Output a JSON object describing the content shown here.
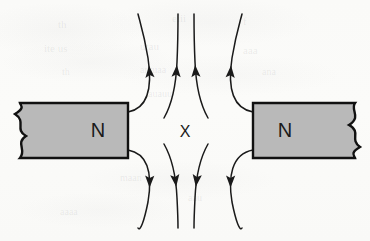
{
  "figure": {
    "background_color": "#fbfbfa",
    "ink_color": "#1a1a1a",
    "magnet_fill_color": "#b9b9b9",
    "magnet_border_color": "#111111"
  },
  "magnets": [
    {
      "id": "left-magnet",
      "pole_label": "N",
      "side": "left",
      "x": 20,
      "y": 103,
      "width": 108,
      "height": 55,
      "label_x": 98,
      "label_y": 132,
      "torn_edge": "left"
    },
    {
      "id": "right-magnet",
      "pole_label": "N",
      "side": "right",
      "x": 253,
      "y": 103,
      "width": 102,
      "height": 55,
      "label_x": 285,
      "label_y": 132,
      "torn_edge": "right"
    }
  ],
  "annotations": [
    {
      "id": "neutral-point",
      "text": "X",
      "x": 185,
      "y": 133
    }
  ],
  "field_lines": [
    {
      "id": "upper-left-outer",
      "direction": "up",
      "path": "M 128 112 C 150 108 152 84 148 58 C 144 34 140 22 138 14",
      "arrow_t": 0.52
    },
    {
      "id": "upper-left-inner",
      "direction": "up",
      "path": "M 164 118 C 172 104 176 86 177 62 C 178 40 178 24 178 14",
      "arrow_t": 0.52
    },
    {
      "id": "upper-right-inner",
      "direction": "up",
      "path": "M 208 118 C 200 104 196 86 195 62 C 194 40 194 24 194 14",
      "arrow_t": 0.52
    },
    {
      "id": "upper-right-outer",
      "direction": "up",
      "path": "M 253 112 C 231 108 228 84 232 58 C 236 34 240 22 242 14",
      "arrow_t": 0.52
    },
    {
      "id": "lower-left-outer",
      "direction": "down",
      "path": "M 128 150 C 150 154 152 178 148 202 C 144 222 140 232 138 228",
      "arrow_t": 0.52
    },
    {
      "id": "lower-left-inner",
      "direction": "down",
      "path": "M 164 144 C 172 158 176 176 177 198 C 178 218 178 228 178 228",
      "arrow_t": 0.52
    },
    {
      "id": "lower-right-inner",
      "direction": "down",
      "path": "M 208 144 C 200 158 196 176 195 198 C 194 218 194 228 194 228",
      "arrow_t": 0.52
    },
    {
      "id": "lower-right-outer",
      "direction": "down",
      "path": "M 253 150 C 231 154 228 178 232 202 C 236 222 240 232 242 228",
      "arrow_t": 0.52
    }
  ],
  "ghost_marks": [
    {
      "text": "th",
      "x": 58,
      "y": 18,
      "size": 11
    },
    {
      "text": "eiii",
      "x": 172,
      "y": 12,
      "size": 11
    },
    {
      "text": "f",
      "x": 243,
      "y": 15,
      "size": 11
    },
    {
      "text": "ite us",
      "x": 44,
      "y": 42,
      "size": 11
    },
    {
      "text": "utau",
      "x": 140,
      "y": 40,
      "size": 11
    },
    {
      "text": "aaa",
      "x": 243,
      "y": 44,
      "size": 11
    },
    {
      "text": "th",
      "x": 62,
      "y": 66,
      "size": 10
    },
    {
      "text": "antuaa",
      "x": 140,
      "y": 64,
      "size": 10
    },
    {
      "text": "ana",
      "x": 262,
      "y": 66,
      "size": 10
    },
    {
      "text": "auauu",
      "x": 148,
      "y": 88,
      "size": 10
    },
    {
      "text": "maan",
      "x": 120,
      "y": 172,
      "size": 10
    },
    {
      "text": "aau",
      "x": 188,
      "y": 192,
      "size": 10
    },
    {
      "text": "aaaa",
      "x": 60,
      "y": 206,
      "size": 10
    }
  ]
}
